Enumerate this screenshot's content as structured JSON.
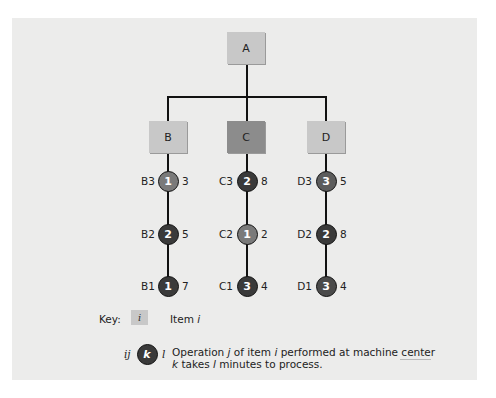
{
  "diagram": {
    "root": {
      "id": "A",
      "label": "A",
      "shade": "light"
    },
    "components": [
      {
        "id": "B",
        "label": "B",
        "shade": "light",
        "operations": [
          {
            "label": "B3",
            "machine_center": "1",
            "minutes": "3",
            "color": "#7a7a7a"
          },
          {
            "label": "B2",
            "machine_center": "2",
            "minutes": "5",
            "color": "#3a3a3a"
          },
          {
            "label": "B1",
            "machine_center": "1",
            "minutes": "7",
            "color": "#3a3a3a"
          }
        ]
      },
      {
        "id": "C",
        "label": "C",
        "shade": "dark",
        "operations": [
          {
            "label": "C3",
            "machine_center": "2",
            "minutes": "8",
            "color": "#3a3a3a"
          },
          {
            "label": "C2",
            "machine_center": "1",
            "minutes": "2",
            "color": "#7a7a7a"
          },
          {
            "label": "C1",
            "machine_center": "3",
            "minutes": "4",
            "color": "#3a3a3a"
          }
        ]
      },
      {
        "id": "D",
        "label": "D",
        "shade": "light",
        "operations": [
          {
            "label": "D3",
            "machine_center": "3",
            "minutes": "5",
            "color": "#5c5c5c"
          },
          {
            "label": "D2",
            "machine_center": "2",
            "minutes": "8",
            "color": "#3a3a3a"
          },
          {
            "label": "D1",
            "machine_center": "3",
            "minutes": "4",
            "color": "#4a4a4a"
          }
        ]
      }
    ]
  },
  "key": {
    "heading": "Key:",
    "item_symbol": "i",
    "item_text_prefix": "Item ",
    "item_text_var": "i",
    "op_left": "ij",
    "op_symbol": "k",
    "op_right": "l",
    "op_line1": {
      "p1": "Operation ",
      "v1": "j",
      "p2": " of item ",
      "v2": "i",
      "p3": " performed at machine center"
    },
    "op_line2": {
      "v1": "k",
      "p1": " takes ",
      "v2": "l",
      "p2": " minutes to process."
    }
  },
  "colors": {
    "panel_bg": "#ececeb",
    "box_light": "#c8c8c8",
    "box_dark": "#8c8c8c",
    "node_light": "#7a7a7a",
    "node_dark": "#3a3a3a",
    "line": "#111111"
  }
}
